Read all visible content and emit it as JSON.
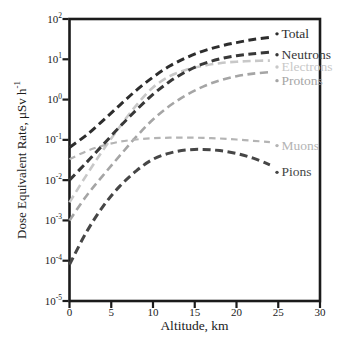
{
  "figure": {
    "background": "#ffffff",
    "frame_color": "#1b1b1b",
    "text_color": "#1b1b1b"
  },
  "chart_data": {
    "type": "line",
    "title": "",
    "xlabel": "Altitude, km",
    "ylabel": "Dose Equivalent Rate, μSv h⁻¹",
    "ylabel_base": "Dose Equivalent Rate, μSv h",
    "ylabel_exponent": "-1",
    "grid": false,
    "line_style": "dashed",
    "legend_position": "inline-right-labels",
    "x_axis": {
      "min": 0,
      "max": 30,
      "ticks": [
        0,
        5,
        10,
        15,
        20,
        25,
        30
      ]
    },
    "y_axis": {
      "scale": "log",
      "tick_base": "10",
      "tick_exponents": [
        2,
        1,
        0,
        -1,
        -2,
        -3,
        -4,
        -5
      ],
      "min_exponent": -5,
      "max_exponent": 2
    },
    "x": [
      0,
      2,
      4,
      6,
      8,
      10,
      12,
      14,
      16,
      18,
      20,
      22,
      24
    ],
    "series": [
      {
        "name": "Total",
        "color": "#2d2d2d",
        "stroke_width": 3,
        "label_dy": -4,
        "values": [
          0.065,
          0.13,
          0.3,
          0.72,
          1.7,
          3.6,
          6.8,
          11,
          16,
          21,
          26,
          31,
          35
        ]
      },
      {
        "name": "Neutrons",
        "color": "#383838",
        "stroke_width": 3,
        "label_dy": 2,
        "values": [
          0.01,
          0.027,
          0.075,
          0.21,
          0.55,
          1.35,
          2.8,
          5.0,
          7.7,
          10.2,
          12.3,
          13.8,
          15
        ]
      },
      {
        "name": "Electrons",
        "color": "#c8c8c8",
        "stroke_width": 2.6,
        "label_dy": 6,
        "values": [
          0.0028,
          0.013,
          0.055,
          0.21,
          0.72,
          2.0,
          3.8,
          5.5,
          6.9,
          8.0,
          8.7,
          9.1,
          9.3
        ]
      },
      {
        "name": "Protons",
        "color": "#a5a5a5",
        "stroke_width": 2.6,
        "label_dy": 8,
        "values": [
          0.001,
          0.004,
          0.013,
          0.04,
          0.12,
          0.32,
          0.7,
          1.3,
          2.1,
          3.0,
          3.8,
          4.4,
          4.8
        ]
      },
      {
        "name": "Muons",
        "color": "#b4b4b4",
        "stroke_width": 2.2,
        "label_dy": 3,
        "values": [
          0.033,
          0.052,
          0.072,
          0.09,
          0.102,
          0.11,
          0.113,
          0.114,
          0.112,
          0.108,
          0.102,
          0.095,
          0.088
        ]
      },
      {
        "name": "Pions",
        "color": "#464646",
        "stroke_width": 3,
        "label_dy": 7,
        "values": [
          8e-05,
          0.0005,
          0.0022,
          0.007,
          0.017,
          0.033,
          0.047,
          0.056,
          0.058,
          0.054,
          0.046,
          0.035,
          0.024
        ]
      }
    ]
  }
}
